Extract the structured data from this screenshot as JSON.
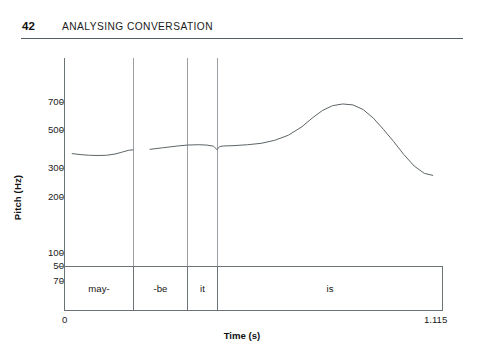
{
  "page": {
    "number": "42",
    "running_head": "ANALYSING CONVERSATION"
  },
  "chart_data": {
    "type": "line",
    "title": "",
    "subtitle": "",
    "xlabel": "Time (s)",
    "ylabel": "Pitch (Hz)",
    "xlim": [
      0,
      1.115
    ],
    "ylim": [
      50,
      700
    ],
    "yscale": "log",
    "grid": false,
    "legend": null,
    "x_tick_labels": [
      "0",
      "1.115"
    ],
    "y_tick_labels": [
      "700",
      "500",
      "300",
      "200",
      "100",
      "70",
      "50"
    ],
    "y_tick_values": [
      700,
      500,
      300,
      200,
      100,
      70,
      50
    ],
    "annotations": [
      {
        "label": "may-",
        "x_start": 0.0,
        "x_end": 0.203
      },
      {
        "label": "-be",
        "x_start": 0.203,
        "x_end": 0.362
      },
      {
        "label": "it",
        "x_start": 0.362,
        "x_end": 0.45
      },
      {
        "label": "is",
        "x_start": 0.45,
        "x_end": 1.115
      }
    ],
    "series": [
      {
        "name": "pitch-contour-segment-1",
        "x": [
          0.024,
          0.05,
          0.075,
          0.1,
          0.125,
          0.15,
          0.17,
          0.19,
          0.203
        ],
        "y": [
          305,
          300,
          297,
          296,
          297,
          303,
          312,
          322,
          324
        ]
      },
      {
        "name": "pitch-contour-segment-2",
        "x": [
          0.253,
          0.29,
          0.33,
          0.362,
          0.395,
          0.42,
          0.44,
          0.45,
          0.458,
          0.47,
          0.5,
          0.54,
          0.58,
          0.62,
          0.66,
          0.7,
          0.73,
          0.76,
          0.79,
          0.82,
          0.85,
          0.88,
          0.91,
          0.94,
          0.97,
          1.0,
          1.03,
          1.06,
          1.085
        ],
        "y": [
          327,
          335,
          344,
          350,
          352,
          350,
          344,
          325,
          342,
          345,
          347,
          352,
          360,
          378,
          410,
          470,
          540,
          610,
          660,
          678,
          668,
          620,
          540,
          450,
          370,
          300,
          250,
          222,
          215
        ]
      }
    ]
  }
}
